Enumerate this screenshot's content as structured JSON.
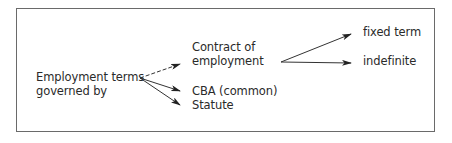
{
  "diagram": {
    "root": {
      "line1": "Employment terms",
      "line2": "governed by"
    },
    "branches": [
      {
        "line1": "Contract of",
        "line2": "employment",
        "edge_style": "dashed"
      },
      {
        "label": "CBA (common)",
        "edge_style": "solid"
      },
      {
        "label": "Statute",
        "edge_style": "solid"
      }
    ],
    "contract_subtypes": [
      {
        "label": "fixed term"
      },
      {
        "label": "indefinite"
      }
    ]
  }
}
